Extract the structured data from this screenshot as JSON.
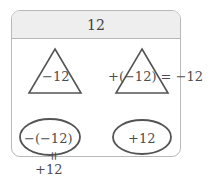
{
  "card": {
    "header": {
      "value": "12"
    },
    "shapes": {
      "triangle_left": {
        "icon": "triangle-icon",
        "label": "−12"
      },
      "triangle_right": {
        "icon": "triangle-icon",
        "expression": "+(−12) = −12"
      },
      "oval_left": {
        "icon": "ellipse-icon",
        "label": "−(−12)"
      },
      "oval_right": {
        "icon": "ellipse-icon",
        "label": "+12"
      }
    },
    "annotations": {
      "equals_connector": "=",
      "result_below": "+12"
    }
  },
  "colors": {
    "border": "#b8b8b8",
    "header_background": "#eeeeee",
    "shape_stroke": "#545454",
    "text": "#4d4d4d",
    "page_background": "#ffffff"
  }
}
